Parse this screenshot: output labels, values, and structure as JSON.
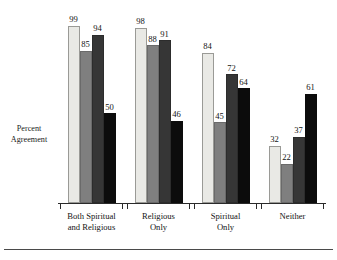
{
  "chart_data": {
    "type": "bar",
    "title": "",
    "xlabel": "",
    "ylabel": "Percent Agreement",
    "ylabel_lines": [
      "Percent",
      "Agreement"
    ],
    "ylim": [
      0,
      110
    ],
    "grid": false,
    "legend_position": "none",
    "categories": [
      "Both Spiritual and Religious",
      "Religious Only",
      "Spiritual Only",
      "Neither"
    ],
    "category_lines": [
      [
        "Both Spiritual",
        "and Religious"
      ],
      [
        "Religious",
        "Only"
      ],
      [
        "Spiritual",
        "Only"
      ],
      [
        "Neither"
      ]
    ],
    "series": [
      {
        "name": "Series 1",
        "color": "#e9e9e5",
        "values": [
          99,
          98,
          84,
          32
        ]
      },
      {
        "name": "Series 2",
        "color": "#7f7f7f",
        "values": [
          85,
          88,
          45,
          22
        ]
      },
      {
        "name": "Series 3",
        "color": "#363636",
        "values": [
          94,
          91,
          72,
          37
        ]
      },
      {
        "name": "Series 4",
        "color": "#0c0c0c",
        "values": [
          50,
          46,
          64,
          61
        ]
      }
    ],
    "value_labels": [
      [
        99,
        85,
        94,
        50
      ],
      [
        98,
        88,
        91,
        46
      ],
      [
        84,
        45,
        72,
        64
      ],
      [
        32,
        22,
        37,
        61
      ]
    ]
  },
  "colors": {
    "series_light": "#e9e9e5",
    "series_medium": "#7f7f7f",
    "series_dark": "#363636",
    "series_black": "#0c0c0c",
    "axis": "#2a2a2a",
    "text": "#141414",
    "background": "#ffffff"
  }
}
